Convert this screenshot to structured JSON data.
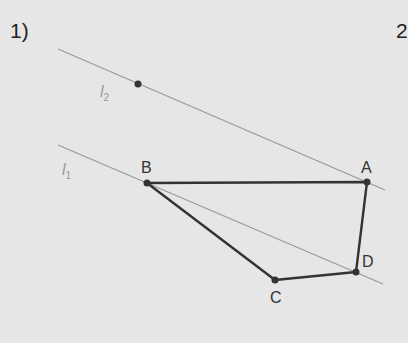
{
  "problems": [
    {
      "label": "1)"
    },
    {
      "label": "2"
    }
  ],
  "lines": [
    {
      "name": "l2",
      "letter": "l",
      "subscript": "2",
      "x1": 58,
      "y1": 49,
      "x2": 385,
      "y2": 190
    },
    {
      "name": "l1",
      "letter": "l",
      "subscript": "1",
      "x1": 58,
      "y1": 145,
      "x2": 383,
      "y2": 284
    }
  ],
  "free_point": {
    "x": 138,
    "y": 84
  },
  "quadrilateral": {
    "vertices": [
      {
        "label": "A",
        "x": 367,
        "y": 182
      },
      {
        "label": "B",
        "x": 147,
        "y": 183
      },
      {
        "label": "C",
        "x": 275,
        "y": 280
      },
      {
        "label": "D",
        "x": 356,
        "y": 272
      }
    ]
  },
  "colors": {
    "background": "#e6e6e6",
    "parallel_lines": "#999999",
    "polygon": "#333333"
  }
}
